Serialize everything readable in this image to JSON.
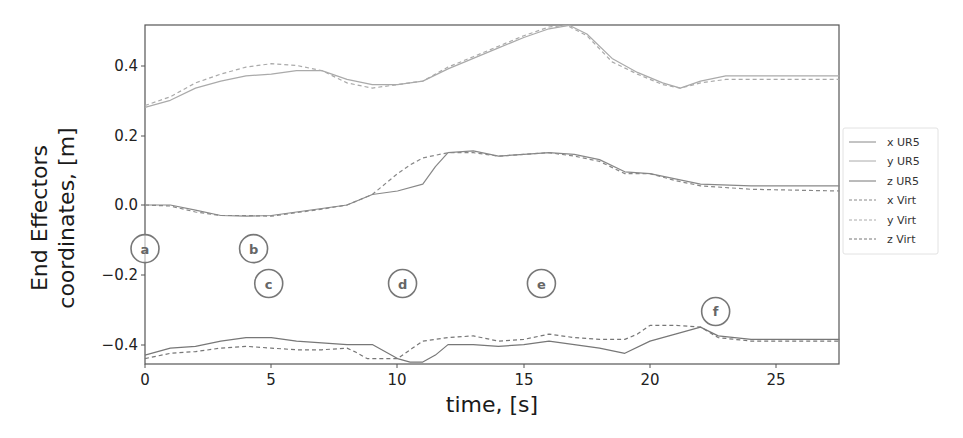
{
  "chart_data": {
    "type": "line",
    "title": "",
    "xlabel": "time, [s]",
    "ylabel_line1": "End Effectors",
    "ylabel_line2": "coordinates, [m]",
    "xlim": [
      0,
      27.5
    ],
    "ylim": [
      -0.45,
      0.52
    ],
    "grid": false,
    "legend_position": "right, outside plot",
    "x_ticks": [
      0,
      5,
      10,
      15,
      20,
      25
    ],
    "x_tick_labels": [
      "0",
      "5",
      "10",
      "15",
      "20",
      "25"
    ],
    "y_ticks": [
      0.4,
      0.2,
      0.0,
      -0.2,
      -0.4
    ],
    "y_tick_labels": [
      "0.4",
      "0.2",
      "0.0",
      "−0.2",
      "−0.4"
    ],
    "series": [
      {
        "name": "x UR5",
        "style": "solid",
        "color": "#888888",
        "points": [
          [
            0,
            0.0
          ],
          [
            1,
            0.0
          ],
          [
            2,
            -0.015
          ],
          [
            3,
            -0.03
          ],
          [
            4,
            -0.032
          ],
          [
            5,
            -0.03
          ],
          [
            6,
            -0.02
          ],
          [
            7,
            -0.01
          ],
          [
            8,
            0.0
          ],
          [
            9,
            0.03
          ],
          [
            10,
            0.04
          ],
          [
            11,
            0.06
          ],
          [
            11.5,
            0.11
          ],
          [
            12,
            0.15
          ],
          [
            13,
            0.155
          ],
          [
            14,
            0.14
          ],
          [
            15,
            0.145
          ],
          [
            16,
            0.15
          ],
          [
            17,
            0.145
          ],
          [
            18,
            0.13
          ],
          [
            19,
            0.095
          ],
          [
            20,
            0.09
          ],
          [
            21,
            0.075
          ],
          [
            22,
            0.06
          ],
          [
            24,
            0.055
          ],
          [
            27.5,
            0.055
          ]
        ]
      },
      {
        "name": "y UR5",
        "style": "solid",
        "color": "#aaaaaa",
        "points": [
          [
            0,
            0.28
          ],
          [
            1,
            0.3
          ],
          [
            2,
            0.335
          ],
          [
            3,
            0.355
          ],
          [
            4,
            0.37
          ],
          [
            5,
            0.375
          ],
          [
            6,
            0.385
          ],
          [
            7,
            0.385
          ],
          [
            8,
            0.36
          ],
          [
            9,
            0.345
          ],
          [
            10,
            0.345
          ],
          [
            11,
            0.355
          ],
          [
            12,
            0.39
          ],
          [
            13,
            0.42
          ],
          [
            14,
            0.45
          ],
          [
            15,
            0.48
          ],
          [
            16,
            0.505
          ],
          [
            16.8,
            0.515
          ],
          [
            17.5,
            0.49
          ],
          [
            18.5,
            0.42
          ],
          [
            19.5,
            0.38
          ],
          [
            20.5,
            0.35
          ],
          [
            21.2,
            0.335
          ],
          [
            22,
            0.355
          ],
          [
            23,
            0.37
          ],
          [
            27.5,
            0.37
          ]
        ]
      },
      {
        "name": "z UR5",
        "style": "solid",
        "color": "#777777",
        "points": [
          [
            0,
            -0.43
          ],
          [
            1,
            -0.41
          ],
          [
            2,
            -0.405
          ],
          [
            3,
            -0.39
          ],
          [
            4,
            -0.38
          ],
          [
            5,
            -0.38
          ],
          [
            6,
            -0.39
          ],
          [
            7,
            -0.395
          ],
          [
            8,
            -0.4
          ],
          [
            9,
            -0.4
          ],
          [
            9.5,
            -0.42
          ],
          [
            10,
            -0.44
          ],
          [
            10.5,
            -0.45
          ],
          [
            11,
            -0.45
          ],
          [
            11.5,
            -0.43
          ],
          [
            12,
            -0.4
          ],
          [
            13,
            -0.4
          ],
          [
            14,
            -0.405
          ],
          [
            15,
            -0.4
          ],
          [
            16,
            -0.39
          ],
          [
            17,
            -0.4
          ],
          [
            18,
            -0.41
          ],
          [
            19,
            -0.425
          ],
          [
            20,
            -0.39
          ],
          [
            21,
            -0.37
          ],
          [
            22,
            -0.35
          ],
          [
            22.7,
            -0.375
          ],
          [
            24,
            -0.385
          ],
          [
            27.5,
            -0.385
          ]
        ]
      },
      {
        "name": "x Virt",
        "style": "dashed",
        "color": "#888888",
        "points": [
          [
            0,
            0.0
          ],
          [
            1,
            -0.003
          ],
          [
            2,
            -0.02
          ],
          [
            3,
            -0.03
          ],
          [
            4,
            -0.03
          ],
          [
            5,
            -0.032
          ],
          [
            6,
            -0.022
          ],
          [
            7,
            -0.012
          ],
          [
            8,
            0.0
          ],
          [
            9,
            0.03
          ],
          [
            10,
            0.09
          ],
          [
            10.5,
            0.115
          ],
          [
            11,
            0.135
          ],
          [
            12,
            0.15
          ],
          [
            13,
            0.15
          ],
          [
            14,
            0.14
          ],
          [
            15,
            0.145
          ],
          [
            16,
            0.15
          ],
          [
            17,
            0.14
          ],
          [
            18,
            0.125
          ],
          [
            19,
            0.09
          ],
          [
            20,
            0.09
          ],
          [
            21,
            0.07
          ],
          [
            22,
            0.055
          ],
          [
            24,
            0.045
          ],
          [
            27.5,
            0.04
          ]
        ]
      },
      {
        "name": "y Virt",
        "style": "dashed",
        "color": "#aaaaaa",
        "points": [
          [
            0,
            0.285
          ],
          [
            1,
            0.31
          ],
          [
            2,
            0.35
          ],
          [
            3,
            0.375
          ],
          [
            4,
            0.395
          ],
          [
            5,
            0.405
          ],
          [
            6,
            0.4
          ],
          [
            7,
            0.385
          ],
          [
            8,
            0.35
          ],
          [
            9,
            0.335
          ],
          [
            10,
            0.345
          ],
          [
            11,
            0.355
          ],
          [
            12,
            0.395
          ],
          [
            13,
            0.425
          ],
          [
            14,
            0.455
          ],
          [
            15,
            0.485
          ],
          [
            16,
            0.51
          ],
          [
            16.7,
            0.515
          ],
          [
            17.5,
            0.485
          ],
          [
            18.5,
            0.41
          ],
          [
            19.5,
            0.375
          ],
          [
            20.5,
            0.345
          ],
          [
            21.2,
            0.335
          ],
          [
            22,
            0.35
          ],
          [
            23,
            0.36
          ],
          [
            27.5,
            0.36
          ]
        ]
      },
      {
        "name": "z Virt",
        "style": "dashed",
        "color": "#777777",
        "points": [
          [
            0,
            -0.44
          ],
          [
            1,
            -0.425
          ],
          [
            2,
            -0.42
          ],
          [
            3,
            -0.41
          ],
          [
            4,
            -0.405
          ],
          [
            5,
            -0.41
          ],
          [
            6,
            -0.415
          ],
          [
            7,
            -0.415
          ],
          [
            8,
            -0.41
          ],
          [
            8.3,
            -0.42
          ],
          [
            8.8,
            -0.44
          ],
          [
            9.5,
            -0.44
          ],
          [
            10,
            -0.44
          ],
          [
            10.6,
            -0.41
          ],
          [
            11,
            -0.39
          ],
          [
            12,
            -0.38
          ],
          [
            13,
            -0.375
          ],
          [
            14,
            -0.39
          ],
          [
            15,
            -0.385
          ],
          [
            16,
            -0.37
          ],
          [
            17,
            -0.38
          ],
          [
            18,
            -0.385
          ],
          [
            19,
            -0.385
          ],
          [
            19.5,
            -0.37
          ],
          [
            20,
            -0.345
          ],
          [
            21,
            -0.345
          ],
          [
            22,
            -0.35
          ],
          [
            22.7,
            -0.38
          ],
          [
            24,
            -0.39
          ],
          [
            27.5,
            -0.39
          ]
        ]
      }
    ],
    "annotations": [
      {
        "label": "a",
        "x": 0,
        "y": -0.125
      },
      {
        "label": "b",
        "x": 4.3,
        "y": -0.125
      },
      {
        "label": "c",
        "x": 4.9,
        "y": -0.225
      },
      {
        "label": "d",
        "x": 10.2,
        "y": -0.225
      },
      {
        "label": "e",
        "x": 15.7,
        "y": -0.225
      },
      {
        "label": "f",
        "x": 22.6,
        "y": -0.305
      }
    ]
  },
  "legend": {
    "items": [
      "x UR5",
      "y UR5",
      "z UR5",
      "x Virt",
      "y Virt",
      "z Virt"
    ]
  }
}
